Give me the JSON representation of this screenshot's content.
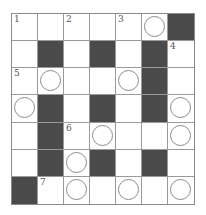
{
  "puzzle": {
    "rows": 7,
    "cols": 7,
    "colors": {
      "black": "#4a4a4a",
      "white": "#ffffff",
      "line": "#9a9a9a"
    },
    "cells": [
      [
        {
          "t": "w",
          "n": "1"
        },
        {
          "t": "w"
        },
        {
          "t": "w",
          "n": "2"
        },
        {
          "t": "w"
        },
        {
          "t": "w",
          "n": "3"
        },
        {
          "t": "w",
          "c": true
        },
        {
          "t": "b"
        }
      ],
      [
        {
          "t": "w"
        },
        {
          "t": "b"
        },
        {
          "t": "w"
        },
        {
          "t": "b"
        },
        {
          "t": "w"
        },
        {
          "t": "b"
        },
        {
          "t": "w",
          "n": "4"
        }
      ],
      [
        {
          "t": "w",
          "n": "5"
        },
        {
          "t": "w",
          "c": true
        },
        {
          "t": "w"
        },
        {
          "t": "w"
        },
        {
          "t": "w",
          "c": true
        },
        {
          "t": "b"
        },
        {
          "t": "w"
        }
      ],
      [
        {
          "t": "w",
          "c": true
        },
        {
          "t": "b"
        },
        {
          "t": "w"
        },
        {
          "t": "b"
        },
        {
          "t": "w"
        },
        {
          "t": "b"
        },
        {
          "t": "w",
          "c": true
        }
      ],
      [
        {
          "t": "w"
        },
        {
          "t": "b"
        },
        {
          "t": "w",
          "n": "6"
        },
        {
          "t": "w",
          "c": true
        },
        {
          "t": "w"
        },
        {
          "t": "w"
        },
        {
          "t": "w",
          "c": true
        }
      ],
      [
        {
          "t": "w"
        },
        {
          "t": "b"
        },
        {
          "t": "w",
          "c": true
        },
        {
          "t": "b"
        },
        {
          "t": "w"
        },
        {
          "t": "b"
        },
        {
          "t": "w"
        }
      ],
      [
        {
          "t": "b"
        },
        {
          "t": "w",
          "n": "7"
        },
        {
          "t": "w",
          "c": true
        },
        {
          "t": "w"
        },
        {
          "t": "w",
          "c": true
        },
        {
          "t": "w"
        },
        {
          "t": "w",
          "c": true
        }
      ]
    ]
  }
}
